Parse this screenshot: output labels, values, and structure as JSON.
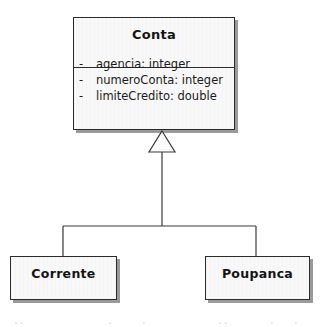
{
  "diagram": {
    "type": "uml-class-diagram",
    "relationship": "generalization",
    "background_color": "#ffffff",
    "line_color": "#3a3a3a",
    "box_fill_color": "#f8f8f8",
    "box_border_color": "#2b2b2b",
    "shadow_color": "#9a9a9a",
    "text_color": "#141414"
  },
  "superclass": {
    "name": "Conta",
    "attributes": [
      {
        "visibility": "-",
        "signature": "agencia:  integer"
      },
      {
        "visibility": "-",
        "signature": "numeroConta:  integer"
      },
      {
        "visibility": "-",
        "signature": "limiteCredito:  double"
      }
    ]
  },
  "subclasses": [
    {
      "name": "Corrente"
    },
    {
      "name": "Poupanca"
    }
  ],
  "artifacts": {
    "fragment_left": "..",
    "fragment_mid_a": ".",
    "fragment_mid_b": ".",
    "fragment_right_a": "..",
    "fragment_right_b": ".",
    "fragment_right_c": "."
  }
}
